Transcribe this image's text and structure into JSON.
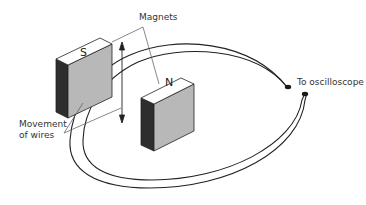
{
  "diagram": {
    "title": "",
    "labels": {
      "magnets": "Magnets",
      "movement_line1": "Movement",
      "movement_line2": "of wires",
      "oscilloscope": "To oscilloscope"
    },
    "magnets": [
      {
        "pole": "S",
        "position": "left"
      },
      {
        "pole": "N",
        "position": "right"
      }
    ],
    "arrow": {
      "direction": "up-and-down",
      "meaning": "movement of wires"
    },
    "colors": {
      "magnet_top": "#ffffff",
      "magnet_front": "#b8b8b8",
      "magnet_side": "#2e2e2e",
      "outline": "#222222",
      "leader_line": "#555555",
      "terminal": "#1a1a1a"
    }
  }
}
